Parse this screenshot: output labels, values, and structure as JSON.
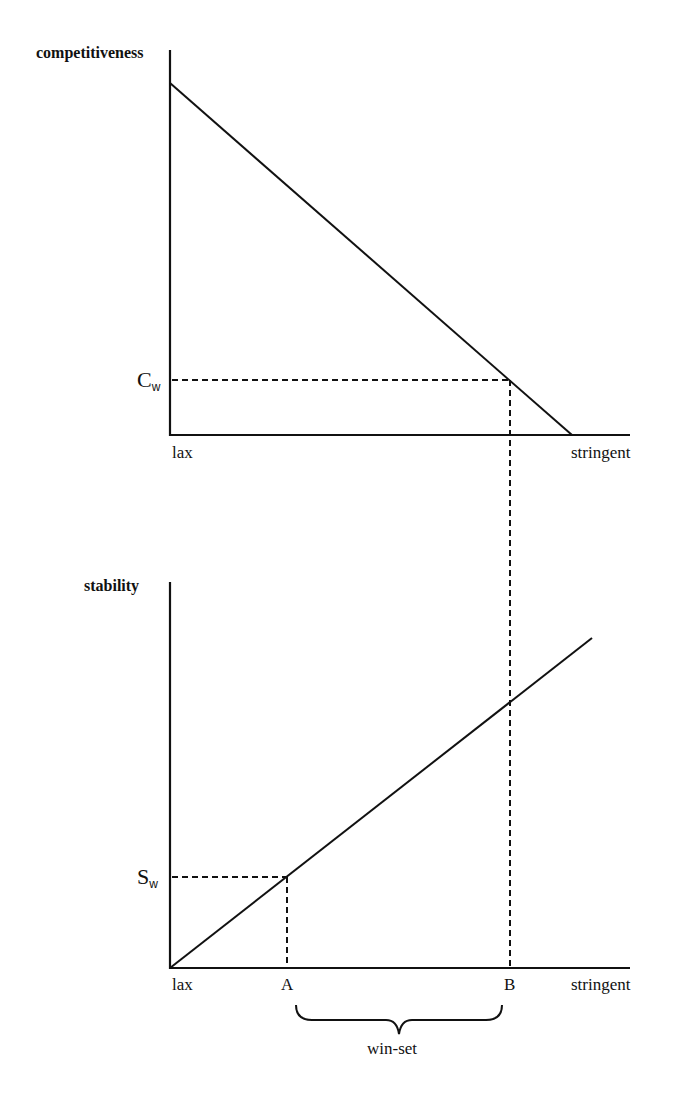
{
  "top_panel": {
    "y_axis_label": "competitiveness",
    "x_min_label": "lax",
    "x_max_label": "stringent",
    "threshold_label": {
      "main": "C",
      "sub": "w"
    }
  },
  "bottom_panel": {
    "y_axis_label": "stability",
    "x_min_label": "lax",
    "x_max_label": "stringent",
    "threshold_label": {
      "main": "S",
      "sub": "w"
    },
    "point_a_label": "A",
    "point_b_label": "B",
    "bracket_label": "win-set"
  },
  "colors": {
    "ink": "#111111",
    "background": "#ffffff"
  }
}
